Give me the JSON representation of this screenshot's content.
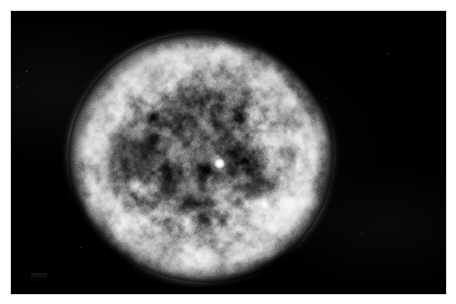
{
  "page": {
    "background_color": "#ffffff",
    "width": 456,
    "height": 304
  },
  "image": {
    "kind": "astronomical-photograph",
    "subject": "planetary nebula",
    "description": "Grayscale telescope image of a roughly circular, limb-brightened planetary nebula shell with mottled filamentary texture, faint concentric spirograph-like rings and a brilliant point-like central star, set against a black sky background.",
    "color_mode": "grayscale",
    "frame": {
      "border_color": "#ffffff",
      "border_left": 11,
      "border_top": 11,
      "plate_width": 435,
      "plate_height": 283,
      "plate_color": "#000000"
    },
    "features": {
      "sky_background_color": "#000000",
      "nebula": {
        "name": "nebula-shell",
        "center_x": 208,
        "center_y": 152,
        "width": 266,
        "height": 250,
        "shape": "slightly irregular ellipse",
        "rim_brightness": "bright",
        "rim_color": "#cdcdcd",
        "interior_color": "#6a6a6a",
        "brightest_arc": "north-west to west limb",
        "secondary_bright_arc": "south-east limb",
        "ring_count": 5,
        "texture": "clumpy mottled knots and filaments"
      },
      "central_star": {
        "name": "central-star",
        "x": 208,
        "y": 152,
        "diameter": 11,
        "color": "#ffffff",
        "appearance": "unresolved brilliant point source"
      },
      "dust_patch": {
        "name": "dark-patch",
        "position": "left of centre",
        "relative_x": 0.25,
        "relative_y": 0.47,
        "color": "#1a1a1a"
      },
      "field_stars": [
        {
          "x": 36,
          "y": 81,
          "size": 2,
          "brightness": 0.3
        },
        {
          "x": 27,
          "y": 96,
          "size": 2,
          "brightness": 0.22
        },
        {
          "x": 398,
          "y": 63,
          "size": 2,
          "brightness": 0.18
        },
        {
          "x": 371,
          "y": 243,
          "size": 2,
          "brightness": 0.16
        },
        {
          "x": 90,
          "y": 257,
          "size": 2,
          "brightness": 0.2
        },
        {
          "x": 336,
          "y": 108,
          "size": 2,
          "brightness": 0.15
        }
      ],
      "corner_artifact": {
        "name": "plate-corner-artifact",
        "x": 20,
        "y": 262,
        "note": "very faint light smudge in lower-left of the plate"
      }
    }
  },
  "chart_data": {
    "type": "heatmap",
    "title": "",
    "xlabel": "",
    "ylabel": "",
    "note": "Radial surface-brightness profile of the nebula sampled from the central star outward (0 = centre, 1 = outer edge of shell). Values are relative grey level 0-255.",
    "x": [
      0.0,
      0.05,
      0.1,
      0.15,
      0.2,
      0.25,
      0.3,
      0.35,
      0.4,
      0.45,
      0.5,
      0.55,
      0.6,
      0.65,
      0.7,
      0.75,
      0.8,
      0.85,
      0.9,
      0.95,
      1.0
    ],
    "series": [
      {
        "name": "radial surface brightness",
        "values": [
          255,
          120,
          96,
          88,
          84,
          86,
          92,
          98,
          106,
          116,
          128,
          142,
          156,
          170,
          184,
          196,
          204,
          200,
          176,
          96,
          8
        ]
      }
    ],
    "ylim": [
      0,
      255
    ],
    "grid": false,
    "legend": "none"
  }
}
